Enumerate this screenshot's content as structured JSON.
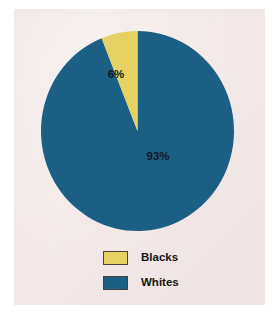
{
  "figure": {
    "background_color": "#ffffff",
    "panel_color": "#f2e8e7"
  },
  "colors": {
    "blacks": "#e5d263",
    "whites": "#1c5f84",
    "label_text": "#101820",
    "swatch_border": "#4a4036"
  },
  "legend": {
    "items": [
      {
        "label": "Blacks",
        "color": "#e5d263"
      },
      {
        "label": "Whites",
        "color": "#1c5f84"
      }
    ]
  },
  "labels": {
    "blacks_pct": "6%",
    "whites_pct": "93%"
  },
  "chart_data": {
    "type": "pie",
    "title": "",
    "categories": [
      "Blacks",
      "Whites"
    ],
    "values": [
      6,
      93
    ],
    "value_labels": [
      "6%",
      "93%"
    ],
    "units": "percent",
    "colors": [
      "#e5d263",
      "#1c5f84"
    ],
    "start_angle_deg": 90,
    "direction": "counterclockwise",
    "legend_position": "bottom",
    "grid": false,
    "xlabel": "",
    "ylabel": ""
  }
}
